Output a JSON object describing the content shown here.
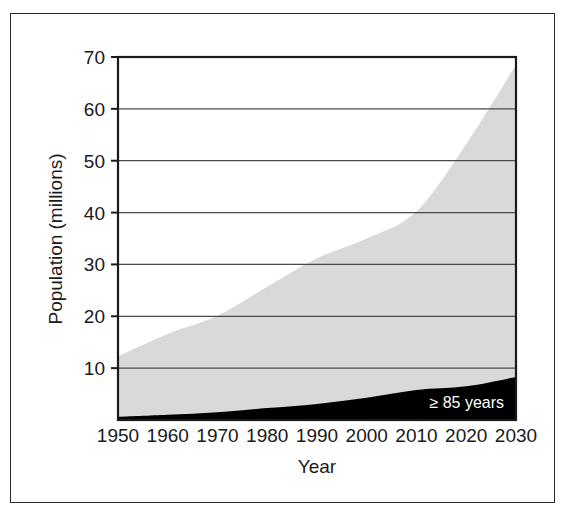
{
  "chart_data": {
    "type": "area",
    "title": "",
    "xlabel": "Year",
    "ylabel": "Population (millions)",
    "xlim": [
      1950,
      2030
    ],
    "ylim": [
      0,
      70
    ],
    "grid": true,
    "legend_position": "inside-bottom-right",
    "stacked": true,
    "x": [
      1950,
      1960,
      1970,
      1980,
      1990,
      2000,
      2010,
      2020,
      2030
    ],
    "xticks": [
      "1950",
      "1960",
      "1970",
      "1980",
      "1990",
      "2000",
      "2010",
      "2020",
      "2030"
    ],
    "yticks": [
      "10",
      "20",
      "30",
      "40",
      "50",
      "60",
      "70"
    ],
    "ytick_values": [
      10,
      20,
      30,
      40,
      50,
      60,
      70
    ],
    "series": [
      {
        "name": "≥ 85 years",
        "color": "#000000",
        "values": [
          0.6,
          1.0,
          1.5,
          2.3,
          3.1,
          4.3,
          5.8,
          6.5,
          8.3
        ]
      },
      {
        "name": "65+ years (total)",
        "color": "#d9d9d9",
        "values": [
          12.3,
          16.6,
          20.1,
          25.7,
          31.2,
          35.0,
          40.2,
          53.2,
          68.5
        ]
      }
    ],
    "annotations": [
      {
        "text": "≥ 85 years",
        "x": 2022,
        "y": 3.2
      }
    ],
    "colors": {
      "area_upper": "#d9d9d9",
      "area_lower": "#000000",
      "grid": "#4a4a4a",
      "axis": "#1a1a1a",
      "frame": "#2a2a2a",
      "background": "#ffffff",
      "label": "#1a1a1a",
      "annotation_text": "#ffffff"
    }
  }
}
